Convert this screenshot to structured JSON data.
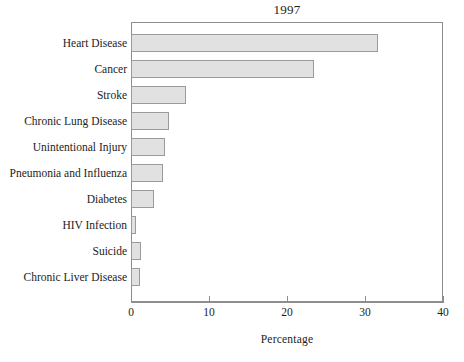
{
  "chart_data": {
    "type": "bar",
    "orientation": "horizontal",
    "title": "1997",
    "xlabel": "Percentage",
    "ylabel": "",
    "xlim": [
      0,
      40
    ],
    "xticks": [
      0,
      10,
      20,
      30,
      40
    ],
    "xtick_labels": [
      "0",
      "10",
      "20",
      "30",
      "40"
    ],
    "grid": false,
    "legend": null,
    "bar_fill_color": "#e1e1e1",
    "bar_edge_color": "#9a9a9a",
    "frame_color": "#8d8d8d",
    "categories": [
      "Heart Disease",
      "Cancer",
      "Stroke",
      "Chronic Lung Disease",
      "Unintentional Injury",
      "Pneumonia and Influenza",
      "Diabetes",
      "HIV Infection",
      "Suicide",
      "Chronic Liver Disease"
    ],
    "values": [
      31.7,
      23.5,
      7.1,
      4.9,
      4.4,
      4.1,
      2.9,
      0.6,
      1.3,
      1.2
    ]
  }
}
